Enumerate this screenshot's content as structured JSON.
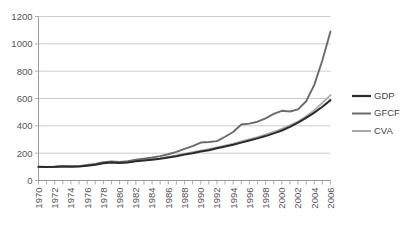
{
  "chart_data": {
    "type": "line",
    "title": "",
    "xlabel": "",
    "ylabel": "",
    "ylim": [
      0,
      1200
    ],
    "xlim": [
      1970,
      2006
    ],
    "yticks": [
      0,
      200,
      400,
      600,
      800,
      1000,
      1200
    ],
    "grid": true,
    "legend_position": "right",
    "x": [
      1970,
      1971,
      1972,
      1973,
      1974,
      1975,
      1976,
      1977,
      1978,
      1979,
      1980,
      1981,
      1982,
      1983,
      1984,
      1985,
      1986,
      1987,
      1988,
      1989,
      1990,
      1991,
      1992,
      1993,
      1994,
      1995,
      1996,
      1997,
      1998,
      1999,
      2000,
      2001,
      2002,
      2003,
      2004,
      2005,
      2006
    ],
    "xtick_labels": [
      "1970",
      "1972",
      "1974",
      "1976",
      "1978",
      "1980",
      "1982",
      "1984",
      "1986",
      "1988",
      "1990",
      "1992",
      "1994",
      "1996",
      "1998",
      "2000",
      "2002",
      "2004",
      "2006"
    ],
    "series": [
      {
        "name": "GDP",
        "color": "#2b2b2b",
        "values": [
          100,
          99,
          100,
          103,
          102,
          103,
          108,
          116,
          126,
          132,
          128,
          132,
          140,
          146,
          152,
          159,
          168,
          178,
          190,
          200,
          212,
          222,
          236,
          249,
          262,
          277,
          292,
          308,
          325,
          345,
          366,
          392,
          423,
          458,
          497,
          540,
          588
        ]
      },
      {
        "name": "GFCF",
        "color": "#6b6b6b",
        "values": [
          100,
          98,
          99,
          104,
          101,
          105,
          113,
          122,
          134,
          140,
          136,
          142,
          152,
          160,
          168,
          178,
          192,
          210,
          232,
          252,
          278,
          282,
          288,
          320,
          355,
          410,
          416,
          430,
          455,
          487,
          510,
          505,
          520,
          580,
          700,
          880,
          1090
        ]
      },
      {
        "name": "CVA",
        "color": "#a8a8a8",
        "values": [
          100,
          99,
          101,
          104,
          101,
          104,
          110,
          118,
          130,
          137,
          130,
          135,
          143,
          149,
          156,
          163,
          173,
          184,
          196,
          207,
          219,
          230,
          243,
          256,
          270,
          286,
          302,
          318,
          336,
          357,
          379,
          404,
          432,
          470,
          515,
          568,
          625
        ]
      }
    ]
  },
  "legend": {
    "items": [
      {
        "label": "GDP"
      },
      {
        "label": "GFCF"
      },
      {
        "label": "CVA"
      }
    ]
  }
}
